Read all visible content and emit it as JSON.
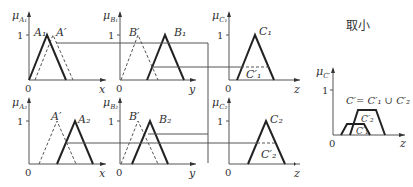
{
  "title_label": "取小",
  "rule1": {
    "antecedent1": {
      "axis_label": "μ",
      "axis_sub": "A₁",
      "set": "A₁",
      "input": "A′",
      "var": "x"
    },
    "antecedent2": {
      "axis_label": "μ",
      "axis_sub": "B₁",
      "set": "B₁",
      "input": "B′",
      "var": "y"
    },
    "consequent": {
      "axis_label": "μ",
      "axis_sub": "C₁",
      "set": "C₁",
      "clipped": "C′₁",
      "var": "z"
    }
  },
  "rule2": {
    "antecedent1": {
      "axis_label": "μ",
      "axis_sub": "A₂",
      "set": "A₂",
      "input": "A′",
      "var": "x"
    },
    "antecedent2": {
      "axis_label": "μ",
      "axis_sub": "B₂",
      "set": "B₂",
      "input": "B′",
      "var": "y"
    },
    "consequent": {
      "axis_label": "μ",
      "axis_sub": "C₂",
      "set": "C₂",
      "clipped": "C′₂",
      "var": "z"
    }
  },
  "result": {
    "axis_label": "μ",
    "axis_sub": "C′",
    "formula": "C′= C′₁ ∪ C′₂",
    "part1": "C′₁",
    "part2": "C′₂",
    "var": "z"
  },
  "ticks": {
    "one": "1",
    "zero": "0"
  }
}
